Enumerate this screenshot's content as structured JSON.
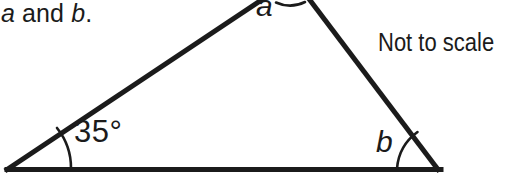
{
  "figure": {
    "kind": "triangle-angle-diagram",
    "background_color": "#ffffff",
    "stroke_color": "#1b1b1b",
    "prompt": {
      "variable_1": "a",
      "conjunction": " and ",
      "variable_2": "b",
      "terminator": "."
    },
    "note": "Not to scale",
    "angles": {
      "left_vertex": {
        "label": "35°",
        "value": 35,
        "unit": "degrees",
        "known": true
      },
      "apex_vertex": {
        "label": "a",
        "value": null,
        "unit": "degrees",
        "known": false
      },
      "right_vertex": {
        "label": "b",
        "value": null,
        "unit": "degrees",
        "known": false
      }
    }
  }
}
